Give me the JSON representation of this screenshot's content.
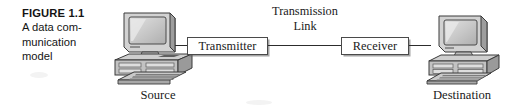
{
  "figure": {
    "number": "FIGURE 1.1",
    "caption_lines": [
      "A data com-",
      "munication",
      "model"
    ],
    "caption_full": "A data communication model"
  },
  "diagram": {
    "nodes": [
      {
        "id": "source",
        "label": "Source",
        "kind": "computer"
      },
      {
        "id": "transmitter",
        "label": "Transmitter",
        "kind": "box"
      },
      {
        "id": "link",
        "label_lines": [
          "Transmission",
          "Link"
        ],
        "label_full": "Transmission Link",
        "kind": "link-label"
      },
      {
        "id": "receiver",
        "label": "Receiver",
        "kind": "box"
      },
      {
        "id": "destination",
        "label": "Destination",
        "kind": "computer"
      }
    ],
    "boxes": {
      "transmitter": "Transmitter",
      "receiver": "Receiver"
    },
    "link": {
      "line1": "Transmission",
      "line2": "Link"
    },
    "endpoints": {
      "source": "Source",
      "destination": "Destination"
    }
  },
  "colors": {
    "background": "#ffffff",
    "ink": "#1a1a1a",
    "line": "#2c2c2c",
    "box_border": "#4a4a4a",
    "case_light": "#d9d9d9",
    "case_mid": "#b4b4b4",
    "case_dark": "#8a8a8a",
    "screen": "#c8c8c8",
    "outline": "#3a3a3a"
  }
}
